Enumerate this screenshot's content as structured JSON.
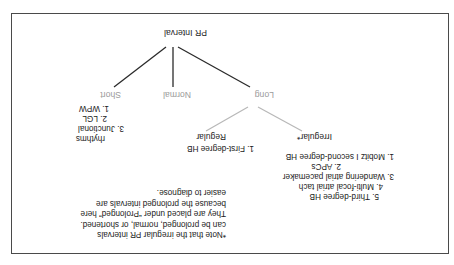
{
  "diagram": {
    "title_node": "PR Interval",
    "branches": [
      {
        "key": "long",
        "label": "Long"
      },
      {
        "key": "normal",
        "label": "Normal"
      },
      {
        "key": "short",
        "label": "Short"
      }
    ],
    "groups": [
      {
        "key": "irregular",
        "heading": "Irregular*",
        "items": [
          "1. Mobitz I second-degree HB",
          "2. APCs",
          "3. Wandering atrial pacemaker",
          "4. Multi-focal atrial tach",
          "5. Third-degree HB"
        ]
      },
      {
        "key": "regular",
        "heading": "Regular",
        "items": [
          "1. First-degree HB"
        ]
      },
      {
        "key": "short_rhythms",
        "heading": "",
        "items": [
          "1. WPW",
          "2. LGL",
          "3. Junctional",
          "rhythms"
        ]
      }
    ],
    "note": {
      "lines": [
        "*Note that the irregular PR intervals",
        "can be prolonged, normal, or shortened.",
        "They are placed under “Prolonged” here",
        "because the prolonged intervals are",
        "easier to diagnose."
      ]
    },
    "colors": {
      "frame": "#4a4a4a",
      "text": "#1b1b1b",
      "branch_label": "#9a9a9a",
      "primary_connector": "#2b2b2b",
      "secondary_connector": "#b8b8b8"
    }
  }
}
